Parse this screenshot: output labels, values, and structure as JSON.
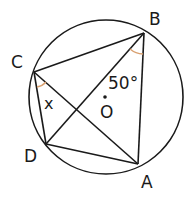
{
  "diagram": {
    "type": "circle-geometry",
    "circle": {
      "center_label": "O",
      "cx": 106,
      "cy": 97,
      "r": 77
    },
    "points": {
      "A": {
        "label": "A",
        "x": 138,
        "y": 164
      },
      "B": {
        "label": "B",
        "x": 144,
        "y": 33
      },
      "C": {
        "label": "C",
        "x": 34,
        "y": 72
      },
      "D": {
        "label": "D",
        "x": 46,
        "y": 144
      }
    },
    "segments": [
      "BC",
      "BD",
      "BA",
      "CD",
      "CA",
      "DA"
    ],
    "angles": [
      {
        "vertex": "B",
        "between": [
          "D",
          "A"
        ],
        "label": "50°"
      },
      {
        "vertex": "C",
        "between": [
          "D",
          "A"
        ],
        "label": "x"
      }
    ],
    "colors": {
      "line": "#1a1a1a",
      "angle_arc": "#d9a070"
    }
  }
}
